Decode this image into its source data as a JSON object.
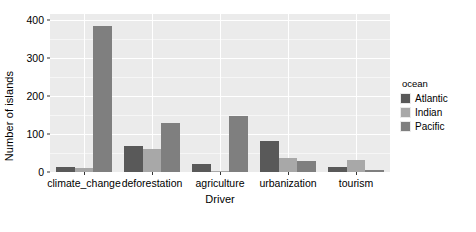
{
  "chart_data": {
    "type": "bar",
    "title": "",
    "subtitle": "",
    "xlabel": "Driver",
    "ylabel": "Number of islands",
    "categories": [
      "climate_change",
      "deforestation",
      "agriculture",
      "urbanization",
      "tourism"
    ],
    "series": [
      {
        "name": "Atlantic",
        "color": "#595959",
        "values": [
          13,
          68,
          21,
          81,
          13
        ]
      },
      {
        "name": "Indian",
        "color": "#a8a8a8",
        "values": [
          10,
          60,
          1,
          36,
          31
        ]
      },
      {
        "name": "Pacific",
        "color": "#7f7f7f",
        "values": [
          383,
          130,
          148,
          30,
          4
        ]
      }
    ],
    "ylim": [
      0,
      415
    ],
    "yticks": [
      0,
      100,
      200,
      300,
      400
    ],
    "ytick_labels": [
      "0",
      "100",
      "200",
      "300",
      "400"
    ],
    "y_minor_ticks": [
      50,
      150,
      250,
      350
    ],
    "grid": true,
    "grid_color": "#ffffff",
    "panel_background": "#ebebeb",
    "legend_position": "right",
    "legend": {
      "title": "ocean",
      "entries": [
        {
          "label": "Atlantic",
          "color": "#595959"
        },
        {
          "label": "Indian",
          "color": "#a8a8a8"
        },
        {
          "label": "Pacific",
          "color": "#7f7f7f"
        }
      ]
    }
  }
}
